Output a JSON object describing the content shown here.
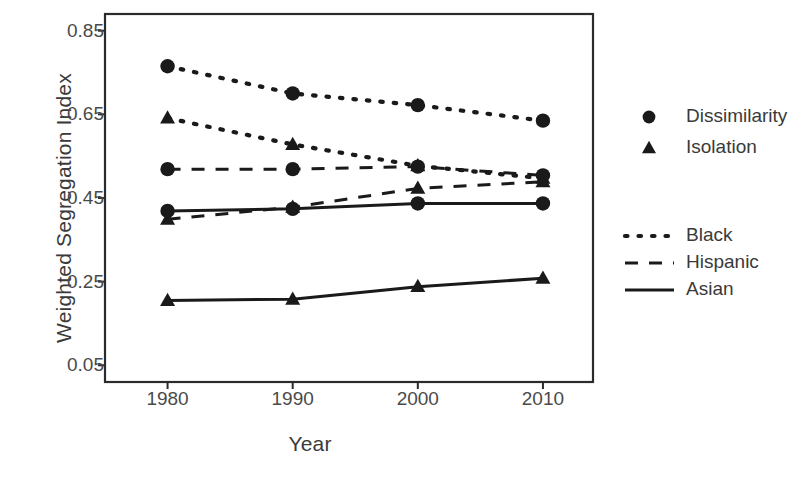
{
  "chart_data": {
    "type": "line",
    "title": "",
    "xlabel": "Year",
    "ylabel": "Weighted Segregation Index",
    "x": [
      1980,
      1990,
      2000,
      2010
    ],
    "xticklabels": [
      "1980",
      "1990",
      "2000",
      "2010"
    ],
    "yticks": [
      0.05,
      0.25,
      0.45,
      0.65,
      0.85
    ],
    "yticklabels": [
      "0.05",
      "0.25",
      "0.45",
      "0.65",
      "0.85"
    ],
    "xlim": [
      1975,
      2014
    ],
    "ylim": [
      0.01,
      0.89
    ],
    "grid": false,
    "legend_position": "right",
    "series": [
      {
        "name": "Black Dissimilarity",
        "group": "Black",
        "measure": "Dissimilarity",
        "marker": "circle",
        "linestyle": "dotted",
        "values": [
          0.765,
          0.7,
          0.672,
          0.635
        ]
      },
      {
        "name": "Black Isolation",
        "group": "Black",
        "measure": "Isolation",
        "marker": "triangle",
        "linestyle": "dotted",
        "values": [
          0.641,
          0.578,
          0.527,
          0.497
        ]
      },
      {
        "name": "Hispanic Dissimilarity",
        "group": "Hispanic",
        "measure": "Dissimilarity",
        "marker": "circle",
        "linestyle": "dashed",
        "values": [
          0.519,
          0.519,
          0.525,
          0.504
        ]
      },
      {
        "name": "Hispanic Isolation",
        "group": "Hispanic",
        "measure": "Isolation",
        "marker": "triangle",
        "linestyle": "dashed",
        "values": [
          0.399,
          0.428,
          0.473,
          0.489
        ]
      },
      {
        "name": "Asian Dissimilarity",
        "group": "Asian",
        "measure": "Dissimilarity",
        "marker": "circle",
        "linestyle": "solid",
        "values": [
          0.419,
          0.424,
          0.437,
          0.437
        ]
      },
      {
        "name": "Asian Isolation",
        "group": "Asian",
        "measure": "Isolation",
        "marker": "triangle",
        "linestyle": "solid",
        "values": [
          0.205,
          0.208,
          0.238,
          0.258
        ]
      }
    ],
    "legend_marker_entries": [
      {
        "label": "Dissimilarity",
        "marker": "circle"
      },
      {
        "label": "Isolation",
        "marker": "triangle"
      }
    ],
    "legend_line_entries": [
      {
        "label": "Black",
        "linestyle": "dotted"
      },
      {
        "label": "Hispanic",
        "linestyle": "dashed"
      },
      {
        "label": "Asian",
        "linestyle": "solid"
      }
    ],
    "colors": {
      "series": "#1a1a1a",
      "axis": "#2b2b2b",
      "text": "#3a3a3a",
      "background": "#ffffff"
    }
  }
}
